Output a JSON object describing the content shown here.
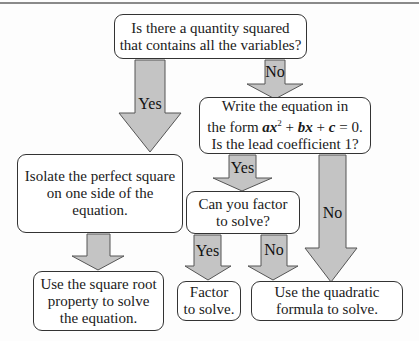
{
  "diagram": {
    "type": "flowchart",
    "colors": {
      "arrow_fill": "#c4c4c4",
      "arrow_stroke": "#555555",
      "box_border": "#333333"
    },
    "nodes": {
      "start": {
        "line1": "Is there a quantity squared",
        "line2": "that contains all the variables?"
      },
      "standard_form": {
        "line1": "Write the equation in",
        "line2_prefix": "the form ",
        "a": "ax",
        "sup": "2",
        "plus1": " + ",
        "b": "bx",
        "plus2": " + ",
        "c": "c",
        "eq": " = 0.",
        "line3": "Is the lead coefficient 1?"
      },
      "isolate": {
        "line1": "Isolate the perfect square",
        "line2": "on one side of the equation."
      },
      "can_factor": {
        "line1": "Can you factor",
        "line2": "to solve?"
      },
      "square_root": {
        "line1": "Use the square root",
        "line2": "property to solve",
        "line3": "the equation."
      },
      "factor": {
        "line1": "Factor",
        "line2": "to solve."
      },
      "quadratic_formula": {
        "line1": "Use the quadratic",
        "line2": "formula to solve."
      }
    },
    "edges": {
      "start_yes": "Yes",
      "start_no": "No",
      "lead_yes": "Yes",
      "lead_no": "No",
      "factor_yes": "Yes",
      "factor_no": "No"
    }
  }
}
